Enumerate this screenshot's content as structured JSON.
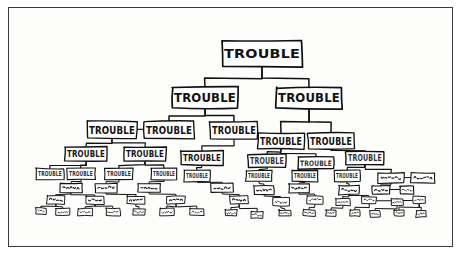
{
  "figure": {
    "style": "hand-drawn comic line art",
    "background_color": "#fdfdfb",
    "ink_color": "#101010",
    "border_color": "#3a3a3a",
    "caption": "",
    "node_label_text": "TROUBLE",
    "note": "Every node in the tree bears the same label; legibility degrades with depth."
  },
  "chart_data": {
    "type": "diagram",
    "subtype": "tree",
    "title": "",
    "xlabel": "",
    "ylabel": "",
    "legend": [],
    "grid": false,
    "orientation": "top-down",
    "levels": 9,
    "label_all_nodes": "TROUBLE",
    "legibility_by_level": [
      "clear",
      "clear",
      "clear",
      "clear",
      "degraded",
      "scribble",
      "scribble",
      "marks",
      "marks"
    ],
    "nodes": [
      {
        "id": "n0",
        "level": 0,
        "x": 253,
        "y": 46,
        "w": 80,
        "h": 26,
        "label": "TROUBLE",
        "legible": "clear"
      },
      {
        "id": "n1",
        "level": 1,
        "x": 196,
        "y": 90,
        "w": 66,
        "h": 21,
        "label": "TROUBLE",
        "legible": "clear"
      },
      {
        "id": "n2",
        "level": 1,
        "x": 300,
        "y": 90,
        "w": 66,
        "h": 21,
        "label": "TROUBLE",
        "legible": "clear"
      },
      {
        "id": "n3",
        "level": 2,
        "x": 103,
        "y": 122,
        "w": 50,
        "h": 17,
        "label": "TROUBLE",
        "legible": "clear"
      },
      {
        "id": "n4",
        "level": 2,
        "x": 160,
        "y": 122,
        "w": 50,
        "h": 17,
        "label": "TROUBLE",
        "legible": "clear"
      },
      {
        "id": "n5",
        "level": 2,
        "x": 225,
        "y": 122,
        "w": 48,
        "h": 17,
        "label": "TROUBLE",
        "legible": "clear"
      },
      {
        "id": "n6",
        "level": 2,
        "x": 272,
        "y": 133,
        "w": 46,
        "h": 16,
        "label": "TROUBLE",
        "legible": "clear"
      },
      {
        "id": "n7",
        "level": 2,
        "x": 322,
        "y": 133,
        "w": 46,
        "h": 16,
        "label": "TROUBLE",
        "legible": "clear"
      },
      {
        "id": "n8",
        "level": 3,
        "x": 77,
        "y": 146,
        "w": 42,
        "h": 14,
        "label": "TROUBLE",
        "legible": "clear"
      },
      {
        "id": "n9",
        "level": 3,
        "x": 136,
        "y": 146,
        "w": 42,
        "h": 14,
        "label": "TROUBLE",
        "legible": "clear"
      },
      {
        "id": "n10",
        "level": 3,
        "x": 193,
        "y": 150,
        "w": 42,
        "h": 14,
        "label": "TROUBLE",
        "legible": "clear"
      },
      {
        "id": "n11",
        "level": 3,
        "x": 258,
        "y": 153,
        "w": 38,
        "h": 13,
        "label": "TROUBLE",
        "legible": "degraded"
      },
      {
        "id": "n12",
        "level": 3,
        "x": 307,
        "y": 155,
        "w": 36,
        "h": 12,
        "label": "TROUBLE",
        "legible": "degraded"
      },
      {
        "id": "n13",
        "level": 3,
        "x": 356,
        "y": 150,
        "w": 38,
        "h": 13,
        "label": "TROUBLE",
        "legible": "degraded"
      },
      {
        "id": "n14",
        "level": 4,
        "x": 41,
        "y": 166,
        "w": 28,
        "h": 11,
        "label": "TROUBLE",
        "legible": "degraded"
      },
      {
        "id": "n15",
        "level": 4,
        "x": 72,
        "y": 166,
        "w": 28,
        "h": 11,
        "label": "TROUBLE",
        "legible": "degraded"
      },
      {
        "id": "n16",
        "level": 4,
        "x": 110,
        "y": 166,
        "w": 28,
        "h": 11,
        "label": "TROUBLE",
        "legible": "degraded"
      },
      {
        "id": "n17",
        "level": 4,
        "x": 155,
        "y": 166,
        "w": 26,
        "h": 11,
        "label": "TROUBLE",
        "legible": "degraded"
      },
      {
        "id": "n18",
        "level": 4,
        "x": 188,
        "y": 168,
        "w": 26,
        "h": 11,
        "label": "TROUBLE",
        "legible": "degraded"
      },
      {
        "id": "n19",
        "level": 4,
        "x": 250,
        "y": 168,
        "w": 26,
        "h": 11,
        "label": "TROUBLE",
        "legible": "degraded"
      },
      {
        "id": "n20",
        "level": 4,
        "x": 296,
        "y": 168,
        "w": 26,
        "h": 11,
        "label": "TROUBLE",
        "legible": "degraded"
      },
      {
        "id": "n21",
        "level": 4,
        "x": 338,
        "y": 168,
        "w": 26,
        "h": 11,
        "label": "TROUBLE",
        "legible": "degraded"
      },
      {
        "id": "n22",
        "level": 4,
        "x": 382,
        "y": 170,
        "w": 26,
        "h": 10,
        "label": "TROUBLE",
        "legible": "scribble"
      },
      {
        "id": "n23",
        "level": 4,
        "x": 414,
        "y": 170,
        "w": 24,
        "h": 10,
        "label": "TROUBLE",
        "legible": "scribble"
      },
      {
        "id": "n24",
        "level": 5,
        "x": 62,
        "y": 180,
        "w": 22,
        "h": 9,
        "label": "TROUBLE",
        "legible": "scribble"
      },
      {
        "id": "n25",
        "level": 5,
        "x": 97,
        "y": 180,
        "w": 22,
        "h": 9,
        "label": "TROUBLE",
        "legible": "scribble"
      },
      {
        "id": "n26",
        "level": 5,
        "x": 140,
        "y": 180,
        "w": 22,
        "h": 9,
        "label": "TROUBLE",
        "legible": "scribble"
      },
      {
        "id": "n27",
        "level": 5,
        "x": 213,
        "y": 180,
        "w": 22,
        "h": 9,
        "label": "TROUBLE",
        "legible": "scribble"
      },
      {
        "id": "n28",
        "level": 5,
        "x": 255,
        "y": 182,
        "w": 20,
        "h": 9,
        "label": "TROUBLE",
        "legible": "scribble"
      },
      {
        "id": "n29",
        "level": 5,
        "x": 290,
        "y": 180,
        "w": 20,
        "h": 9,
        "label": "TROUBLE",
        "legible": "scribble"
      },
      {
        "id": "n30",
        "level": 5,
        "x": 340,
        "y": 182,
        "w": 20,
        "h": 9,
        "label": "TROUBLE",
        "legible": "scribble"
      },
      {
        "id": "n31",
        "level": 5,
        "x": 372,
        "y": 182,
        "w": 18,
        "h": 8,
        "label": "TROUBLE",
        "legible": "scribble"
      },
      {
        "id": "n32",
        "level": 5,
        "x": 398,
        "y": 182,
        "w": 14,
        "h": 8,
        "label": "TROUBLE",
        "legible": "marks"
      },
      {
        "id": "n33",
        "level": 6,
        "x": 47,
        "y": 192,
        "w": 18,
        "h": 8,
        "label": "TROUBLE",
        "legible": "scribble"
      },
      {
        "id": "n34",
        "level": 6,
        "x": 86,
        "y": 192,
        "w": 18,
        "h": 8,
        "label": "TROUBLE",
        "legible": "scribble"
      },
      {
        "id": "n35",
        "level": 6,
        "x": 127,
        "y": 192,
        "w": 18,
        "h": 8,
        "label": "TROUBLE",
        "legible": "scribble"
      },
      {
        "id": "n36",
        "level": 6,
        "x": 167,
        "y": 192,
        "w": 18,
        "h": 8,
        "label": "TROUBLE",
        "legible": "scribble"
      },
      {
        "id": "n37",
        "level": 6,
        "x": 230,
        "y": 192,
        "w": 18,
        "h": 8,
        "label": "TROUBLE",
        "legible": "scribble"
      },
      {
        "id": "n38",
        "level": 6,
        "x": 272,
        "y": 194,
        "w": 16,
        "h": 8,
        "label": "TROUBLE",
        "legible": "marks"
      },
      {
        "id": "n39",
        "level": 6,
        "x": 306,
        "y": 192,
        "w": 16,
        "h": 8,
        "label": "TROUBLE",
        "legible": "marks"
      },
      {
        "id": "n40",
        "level": 6,
        "x": 334,
        "y": 194,
        "w": 14,
        "h": 7,
        "label": "TROUBLE",
        "legible": "marks"
      },
      {
        "id": "n41",
        "level": 6,
        "x": 360,
        "y": 192,
        "w": 14,
        "h": 7,
        "label": "TROUBLE",
        "legible": "marks"
      },
      {
        "id": "n42",
        "level": 6,
        "x": 388,
        "y": 194,
        "w": 12,
        "h": 7,
        "label": "TROUBLE",
        "legible": "marks"
      },
      {
        "id": "n43",
        "level": 6,
        "x": 410,
        "y": 192,
        "w": 12,
        "h": 7,
        "label": "TROUBLE",
        "legible": "marks"
      },
      {
        "id": "n44",
        "level": 7,
        "x": 32,
        "y": 203,
        "w": 10,
        "h": 6,
        "label": "TROUBLE",
        "legible": "marks"
      },
      {
        "id": "n45",
        "level": 7,
        "x": 54,
        "y": 204,
        "w": 14,
        "h": 7,
        "label": "TROUBLE",
        "legible": "marks"
      },
      {
        "id": "n46",
        "level": 7,
        "x": 76,
        "y": 204,
        "w": 14,
        "h": 7,
        "label": "TROUBLE",
        "legible": "marks"
      },
      {
        "id": "n47",
        "level": 7,
        "x": 104,
        "y": 204,
        "w": 14,
        "h": 7,
        "label": "TROUBLE",
        "legible": "marks"
      },
      {
        "id": "n48",
        "level": 7,
        "x": 130,
        "y": 204,
        "w": 12,
        "h": 6,
        "label": "TROUBLE",
        "legible": "marks"
      },
      {
        "id": "n49",
        "level": 7,
        "x": 158,
        "y": 204,
        "w": 14,
        "h": 7,
        "label": "TROUBLE",
        "legible": "marks"
      },
      {
        "id": "n50",
        "level": 7,
        "x": 188,
        "y": 204,
        "w": 14,
        "h": 7,
        "label": "TROUBLE",
        "legible": "marks"
      },
      {
        "id": "n51",
        "level": 7,
        "x": 222,
        "y": 205,
        "w": 12,
        "h": 6,
        "label": "TROUBLE",
        "legible": "marks"
      },
      {
        "id": "n52",
        "level": 7,
        "x": 248,
        "y": 207,
        "w": 12,
        "h": 6,
        "label": "TROUBLE",
        "legible": "marks"
      },
      {
        "id": "n53",
        "level": 7,
        "x": 276,
        "y": 205,
        "w": 12,
        "h": 6,
        "label": "TROUBLE",
        "legible": "marks"
      },
      {
        "id": "n54",
        "level": 7,
        "x": 300,
        "y": 205,
        "w": 12,
        "h": 6,
        "label": "TROUBLE",
        "legible": "marks"
      },
      {
        "id": "n55",
        "level": 7,
        "x": 322,
        "y": 205,
        "w": 10,
        "h": 6,
        "label": "TROUBLE",
        "legible": "marks"
      },
      {
        "id": "n56",
        "level": 7,
        "x": 346,
        "y": 205,
        "w": 10,
        "h": 6,
        "label": "TROUBLE",
        "legible": "marks"
      },
      {
        "id": "n57",
        "level": 7,
        "x": 366,
        "y": 206,
        "w": 10,
        "h": 6,
        "label": "TROUBLE",
        "legible": "marks"
      },
      {
        "id": "n58",
        "level": 7,
        "x": 390,
        "y": 205,
        "w": 10,
        "h": 6,
        "label": "TROUBLE",
        "legible": "marks"
      },
      {
        "id": "n59",
        "level": 7,
        "x": 412,
        "y": 206,
        "w": 10,
        "h": 6,
        "label": "TROUBLE",
        "legible": "marks"
      }
    ],
    "edges": [
      [
        "n0",
        "n1"
      ],
      [
        "n0",
        "n2"
      ],
      [
        "n1",
        "n4"
      ],
      [
        "n1",
        "n5"
      ],
      [
        "n2",
        "n6"
      ],
      [
        "n2",
        "n7"
      ],
      [
        "n4",
        "n3"
      ],
      [
        "n5",
        "n10"
      ],
      [
        "n3",
        "n8"
      ],
      [
        "n3",
        "n9"
      ],
      [
        "n6",
        "n11"
      ],
      [
        "n6",
        "n12"
      ],
      [
        "n7",
        "n13"
      ],
      [
        "n8",
        "n14"
      ],
      [
        "n8",
        "n15"
      ],
      [
        "n9",
        "n16"
      ],
      [
        "n9",
        "n17"
      ],
      [
        "n10",
        "n18"
      ],
      [
        "n11",
        "n19"
      ],
      [
        "n12",
        "n20"
      ],
      [
        "n13",
        "n21"
      ],
      [
        "n13",
        "n22"
      ],
      [
        "n22",
        "n23"
      ],
      [
        "n15",
        "n24"
      ],
      [
        "n16",
        "n25"
      ],
      [
        "n17",
        "n26"
      ],
      [
        "n18",
        "n27"
      ],
      [
        "n19",
        "n28"
      ],
      [
        "n20",
        "n29"
      ],
      [
        "n21",
        "n30"
      ],
      [
        "n22",
        "n31"
      ],
      [
        "n31",
        "n32"
      ],
      [
        "n24",
        "n33"
      ],
      [
        "n24",
        "n34"
      ],
      [
        "n25",
        "n35"
      ],
      [
        "n26",
        "n36"
      ],
      [
        "n27",
        "n37"
      ],
      [
        "n28",
        "n38"
      ],
      [
        "n29",
        "n39"
      ],
      [
        "n30",
        "n40"
      ],
      [
        "n30",
        "n41"
      ],
      [
        "n41",
        "n42"
      ],
      [
        "n42",
        "n43"
      ],
      [
        "n33",
        "n44"
      ],
      [
        "n33",
        "n45"
      ],
      [
        "n34",
        "n46"
      ],
      [
        "n34",
        "n47"
      ],
      [
        "n35",
        "n48"
      ],
      [
        "n36",
        "n49"
      ],
      [
        "n36",
        "n50"
      ],
      [
        "n37",
        "n51"
      ],
      [
        "n37",
        "n52"
      ],
      [
        "n38",
        "n53"
      ],
      [
        "n39",
        "n54"
      ],
      [
        "n40",
        "n55"
      ],
      [
        "n41",
        "n56"
      ],
      [
        "n42",
        "n57"
      ],
      [
        "n43",
        "n58"
      ],
      [
        "n43",
        "n59"
      ]
    ]
  }
}
